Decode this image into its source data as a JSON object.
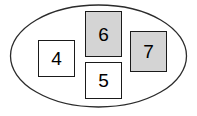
{
  "diagram": {
    "type": "euler-set-diagram",
    "title": "",
    "canvas": {
      "width": 197,
      "height": 116,
      "background": "#ffffff"
    },
    "outline": {
      "shape": "ellipse",
      "label": "",
      "stroke": "#2b2b2b",
      "stroke_width": 1.3,
      "fill": "none",
      "center_x": 98.5,
      "center_y": 56,
      "radius_x": 88,
      "radius_y": 51
    },
    "nodes": [
      {
        "id": "node-4",
        "label": "4",
        "fill": "#ffffff",
        "stroke": "#1a1a1a",
        "x": 38,
        "y": 40,
        "width": 37,
        "height": 37,
        "inside_set": true
      },
      {
        "id": "node-6",
        "label": "6",
        "fill": "#d4d4d4",
        "stroke": "#1a1a1a",
        "x": 85,
        "y": 11,
        "width": 37,
        "height": 46,
        "inside_set": true
      },
      {
        "id": "node-7",
        "label": "7",
        "fill": "#d4d4d4",
        "stroke": "#1a1a1a",
        "x": 130,
        "y": 31,
        "width": 37,
        "height": 41,
        "inside_set": true
      },
      {
        "id": "node-5",
        "label": "5",
        "fill": "#ffffff",
        "stroke": "#1a1a1a",
        "x": 85,
        "y": 62,
        "width": 37,
        "height": 37,
        "inside_set": false
      }
    ]
  }
}
